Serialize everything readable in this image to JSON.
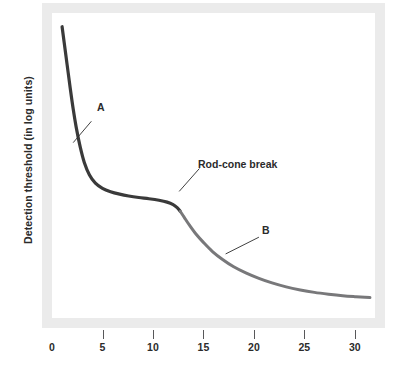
{
  "figure": {
    "y_axis_title": "Detection threshold (in log units)",
    "frame_color": "#ebebeb",
    "background": "#ffffff"
  },
  "annotations": [
    {
      "name": "curve-a-label",
      "text": "A"
    },
    {
      "name": "curve-b-label",
      "text": "B"
    },
    {
      "name": "rod-cone-break-label",
      "text": "Rod-cone break"
    }
  ],
  "axis": {
    "x_ticks": [
      {
        "value": 0,
        "label": "0",
        "has_mark": false
      },
      {
        "value": 5,
        "label": "5",
        "has_mark": true
      },
      {
        "value": 10,
        "label": "10",
        "has_mark": true
      },
      {
        "value": 15,
        "label": "15",
        "has_mark": true
      },
      {
        "value": 20,
        "label": "20",
        "has_mark": true
      },
      {
        "value": 25,
        "label": "25",
        "has_mark": true
      },
      {
        "value": 30,
        "label": "30",
        "has_mark": true
      }
    ]
  },
  "chart_data": {
    "type": "line",
    "title": "",
    "xlabel": "",
    "ylabel": "Detection threshold (in log units)",
    "xlim": [
      0,
      32
    ],
    "ylim": [
      0,
      10
    ],
    "grid": false,
    "legend": "none",
    "annotations": [
      {
        "text": "A",
        "x": 3.9,
        "y": 6.45,
        "leader_to": {
          "x": 2.1,
          "y": 5.75
        }
      },
      {
        "text": "B",
        "x": 20.5,
        "y": 2.65,
        "leader_to": {
          "x": 17.2,
          "y": 2.1
        }
      },
      {
        "text": "Rod-cone break",
        "x": 14.6,
        "y": 4.9,
        "leader_to": {
          "x": 12.6,
          "y": 4.15
        }
      }
    ],
    "series": [
      {
        "name": "A",
        "label": "Rod-cone dark adaptation: cone branch",
        "color": "#3a3a3a",
        "width_px": 3.2,
        "x": [
          1.0,
          1.2,
          1.5,
          1.8,
          2.1,
          2.4,
          2.8,
          3.2,
          3.7,
          4.3,
          5.0,
          5.8,
          6.7,
          7.6,
          8.6,
          9.6,
          10.6,
          11.4,
          12.0,
          12.4,
          12.7
        ],
        "y": [
          9.55,
          9.05,
          8.3,
          7.55,
          6.85,
          6.25,
          5.6,
          5.1,
          4.7,
          4.42,
          4.25,
          4.14,
          4.06,
          4.0,
          3.95,
          3.91,
          3.86,
          3.8,
          3.72,
          3.62,
          3.5
        ]
      },
      {
        "name": "B",
        "label": "Rod-cone dark adaptation: rod branch",
        "color": "#78787a",
        "width_px": 3.0,
        "x": [
          12.7,
          13.1,
          13.6,
          14.2,
          15.0,
          15.9,
          16.9,
          18.0,
          19.2,
          20.5,
          21.8,
          23.2,
          24.6,
          26.0,
          27.4,
          28.8,
          30.0,
          31.0,
          31.5
        ],
        "y": [
          3.5,
          3.3,
          3.05,
          2.78,
          2.48,
          2.18,
          1.92,
          1.68,
          1.48,
          1.3,
          1.15,
          1.02,
          0.92,
          0.84,
          0.78,
          0.73,
          0.7,
          0.68,
          0.67
        ]
      }
    ]
  }
}
